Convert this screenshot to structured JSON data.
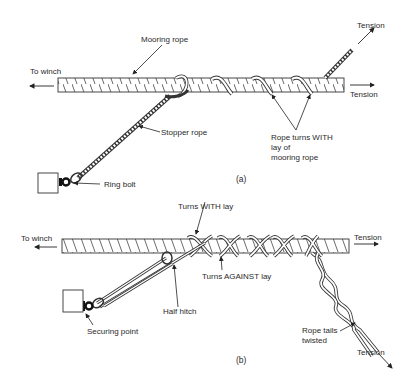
{
  "figure_a": {
    "caption": "(a)",
    "labels": {
      "mooring_rope": "Mooring rope",
      "to_winch": "To winch",
      "tension_top": "Tension",
      "tension_right": "Tension",
      "stopper_rope": "Stopper rope",
      "ring_bolt": "Ring bolt",
      "turns_with_lay_1": "Rope turns WITH",
      "turns_with_lay_2": "lay of",
      "turns_with_lay_3": "mooring rope"
    }
  },
  "figure_b": {
    "caption": "(b)",
    "labels": {
      "turns_with_lay": "Turns WITH lay",
      "to_winch": "To winch",
      "tension_right": "Tension",
      "turns_against_lay": "Turns AGAINST lay",
      "half_hitch": "Half hitch",
      "securing_point": "Securing point",
      "rope_tails_1": "Rope tails",
      "rope_tails_2": "twisted",
      "tension_bottom": "Tension"
    }
  },
  "colors": {
    "line": "#333333",
    "background": "#ffffff"
  }
}
